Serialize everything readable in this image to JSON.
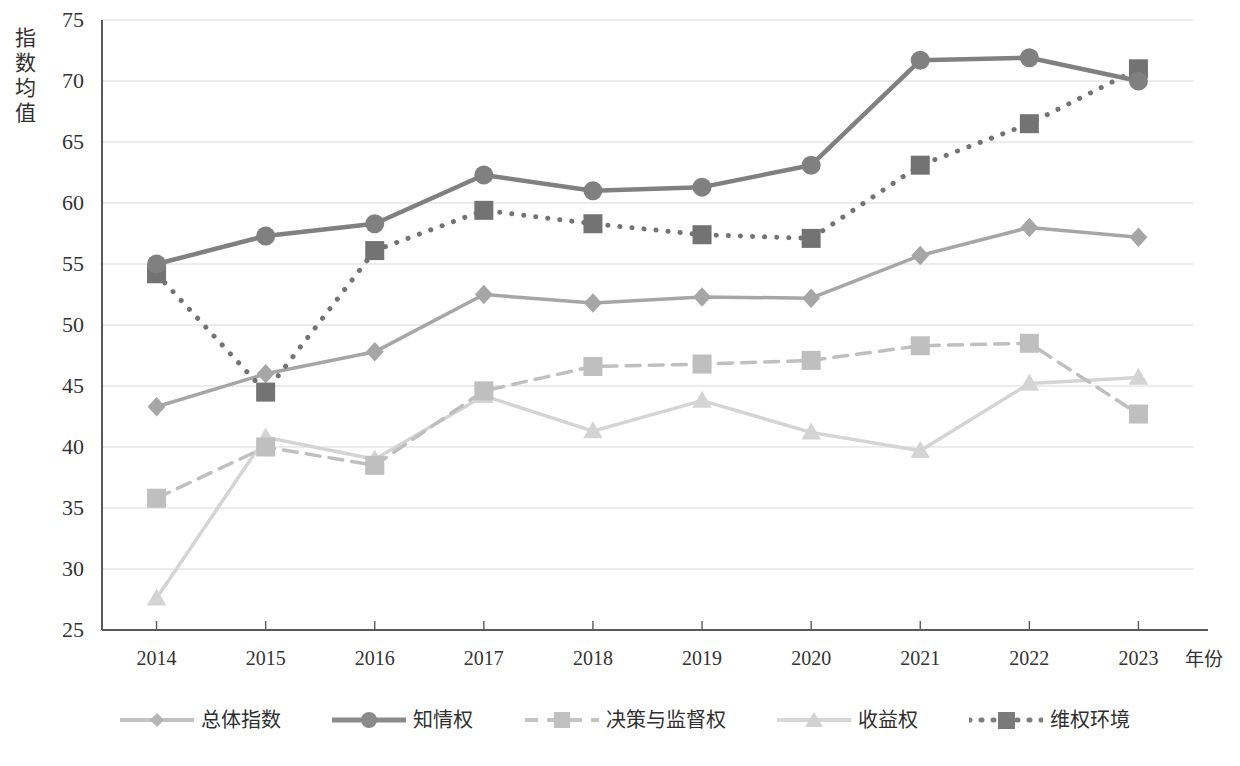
{
  "chart_data": {
    "type": "line",
    "title": "",
    "xlabel": "年份",
    "ylabel": "指数均值",
    "categories": [
      "2014",
      "2015",
      "2016",
      "2017",
      "2018",
      "2019",
      "2020",
      "2021",
      "2022",
      "2023"
    ],
    "ylim": [
      25,
      75
    ],
    "yticks": [
      "25",
      "30",
      "35",
      "40",
      "45",
      "50",
      "55",
      "60",
      "65",
      "70",
      "75"
    ],
    "grid": true,
    "legend_position": "bottom",
    "series": [
      {
        "name": "总体指数",
        "marker": "diamond",
        "line_style": "solid",
        "color": "#a6a6a6",
        "values": [
          43.3,
          46.0,
          47.8,
          52.5,
          51.8,
          52.3,
          52.2,
          55.7,
          58.0,
          57.2
        ]
      },
      {
        "name": "知情权",
        "marker": "circle",
        "line_style": "solid",
        "color": "#808080",
        "values": [
          55.0,
          57.3,
          58.3,
          62.3,
          61.0,
          61.3,
          63.1,
          71.7,
          71.9,
          70.0
        ]
      },
      {
        "name": "决策与监督权",
        "marker": "square",
        "line_style": "dashed",
        "color": "#bfbfbf",
        "values": [
          35.8,
          40.0,
          38.5,
          44.6,
          46.6,
          46.8,
          47.1,
          48.3,
          48.5,
          42.7
        ]
      },
      {
        "name": "收益权",
        "marker": "triangle",
        "line_style": "solid",
        "color": "#d4d4d4",
        "values": [
          27.6,
          40.8,
          39.0,
          44.2,
          41.3,
          43.8,
          41.2,
          39.7,
          45.2,
          45.7
        ]
      },
      {
        "name": "维权环境",
        "marker": "square",
        "line_style": "dotted",
        "color": "#737373",
        "values": [
          54.2,
          44.5,
          56.1,
          59.4,
          58.3,
          57.4,
          57.1,
          63.1,
          66.5,
          71.0
        ]
      }
    ]
  },
  "axis": {
    "y_title": "指数均值",
    "x_title": "年份"
  },
  "colors": {
    "axis_line": "#595959",
    "grid_line": "#d9d9d9",
    "text": "#333333"
  }
}
